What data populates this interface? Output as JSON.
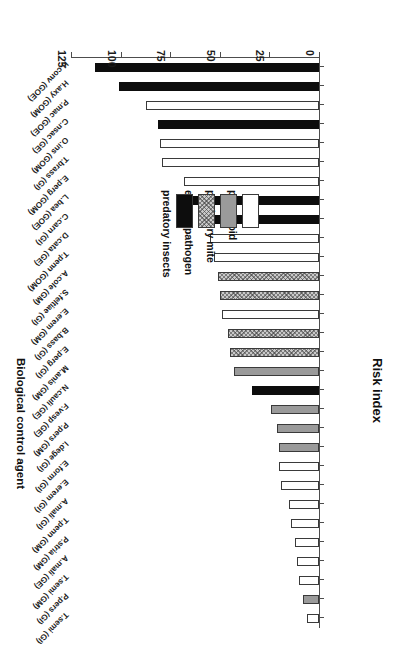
{
  "chart_data": {
    "type": "bar",
    "orientation": "horizontal",
    "title": "",
    "xlabel": "Risk index",
    "ylabel": "Biological control agent",
    "xlim": [
      0,
      125
    ],
    "xticks": [
      0,
      25,
      50,
      75,
      100,
      125
    ],
    "grid": false,
    "rotated_180": true,
    "legend": {
      "position": "inside-left",
      "entries": [
        {
          "label": "parasitoid",
          "key": "parasitoid",
          "color": "#ffffff",
          "pattern": "solid-white"
        },
        {
          "label": "predatory mite",
          "key": "mite",
          "color": "#9a9a9a",
          "pattern": "solid-gray"
        },
        {
          "label": "entomopathogen",
          "key": "entomopathogen",
          "color": "#c9c9c9",
          "pattern": "cross-hatch"
        },
        {
          "label": "predatory insects",
          "key": "insects",
          "color": "#0d0d0d",
          "pattern": "solid-black"
        }
      ]
    },
    "categories": [
      "T.semi (GI)",
      "P.pers (GI)",
      "T.semi (GM)",
      "A.mali (GE)",
      "P.stria (GM)",
      "T.penn (GM)",
      "A.mali (GI)",
      "E.erem (GI)",
      "E.form (GI)",
      "I.dege (GI)",
      "P.pers (GM)",
      "F.vesp (GE)",
      "N.cauli (GE)",
      "M.anis (GM)",
      "E.perg (GI)",
      "B.bass (GI)",
      "E.erem (GM)",
      "S.feltiae (GI)",
      "A.cole (GM)",
      "T.penn (GOM)",
      "D.cata (GE)",
      "C.carn (GI)",
      "L.bea (GOE)",
      "E.perg (GOM)",
      "T.brass (GI)",
      "O.ins (GOM)",
      "C.nsac (GE)",
      "P.mac (GOE)",
      "H.axy (GOM)",
      "H.conv (GOE)"
    ],
    "values": [
      6,
      8,
      10,
      11,
      12,
      14,
      15,
      19,
      20,
      20,
      21,
      24,
      34,
      43,
      45,
      46,
      49,
      50,
      51,
      53,
      55,
      61,
      66,
      68,
      79,
      80,
      81,
      87,
      101,
      113
    ],
    "groups": [
      "parasitoid",
      "mite",
      "parasitoid",
      "parasitoid",
      "parasitoid",
      "parasitoid",
      "parasitoid",
      "parasitoid",
      "parasitoid",
      "mite",
      "mite",
      "mite",
      "insects",
      "mite",
      "entomopathogen",
      "entomopathogen",
      "parasitoid",
      "entomopathogen",
      "entomopathogen",
      "parasitoid",
      "parasitoid",
      "insects",
      "insects",
      "parasitoid",
      "parasitoid",
      "parasitoid",
      "insects",
      "parasitoid",
      "insects",
      "insects"
    ]
  },
  "axes": {
    "value_axis_title": "Risk index",
    "category_axis_title": "Biological control agent",
    "tick_labels": [
      "0",
      "25",
      "50",
      "75",
      "100",
      "125"
    ]
  }
}
